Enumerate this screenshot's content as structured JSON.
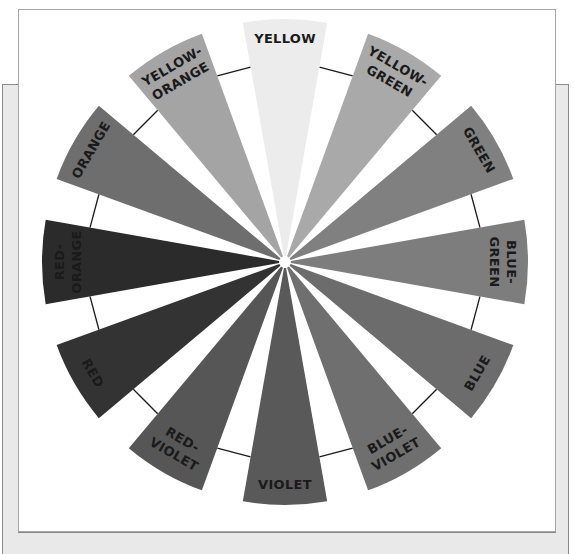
{
  "diagram": {
    "type": "color-wheel",
    "center": [
      285,
      262
    ],
    "outer_radius": 243,
    "inner_radius": 6,
    "wedge_span_deg": 20,
    "step_deg": 30,
    "connector_radius": [
      190,
      206
    ],
    "wedges": [
      {
        "id": "yellow",
        "lines": [
          "YELLOW"
        ],
        "angle": 90,
        "color": "#ececec"
      },
      {
        "id": "yellow-green",
        "lines": [
          "YELLOW-",
          "GREEN"
        ],
        "angle": 60,
        "color": "#a9a9a9"
      },
      {
        "id": "green",
        "lines": [
          "GREEN"
        ],
        "angle": 30,
        "color": "#808080"
      },
      {
        "id": "blue-green",
        "lines": [
          "BLUE-",
          "GREEN"
        ],
        "angle": 0,
        "color": "#7d7d7d"
      },
      {
        "id": "blue",
        "lines": [
          "BLUE"
        ],
        "angle": -30,
        "color": "#6c6c6c"
      },
      {
        "id": "blue-violet",
        "lines": [
          "BLUE-",
          "VIOLET"
        ],
        "angle": -60,
        "color": "#6f6f6f"
      },
      {
        "id": "violet",
        "lines": [
          "VIOLET"
        ],
        "angle": -90,
        "color": "#595959"
      },
      {
        "id": "red-violet",
        "lines": [
          "RED-",
          "VIOLET"
        ],
        "angle": -120,
        "color": "#565656"
      },
      {
        "id": "red",
        "lines": [
          "RED"
        ],
        "angle": -150,
        "color": "#333333"
      },
      {
        "id": "red-orange",
        "lines": [
          "RED-",
          "ORANGE"
        ],
        "angle": 180,
        "color": "#2b2b2b"
      },
      {
        "id": "orange",
        "lines": [
          "ORANGE"
        ],
        "angle": 150,
        "color": "#6e6e6e"
      },
      {
        "id": "yellow-orange",
        "lines": [
          "YELLOW-",
          "ORANGE"
        ],
        "angle": 120,
        "color": "#a4a4a4"
      }
    ],
    "connectors": [
      {
        "between": [
          "yellow",
          "yellow-orange"
        ],
        "angle": 105
      },
      {
        "between": [
          "yellow-green",
          "green"
        ],
        "angle": 45
      },
      {
        "between": [
          "green",
          "blue-green"
        ],
        "angle": 15
      },
      {
        "between": [
          "blue-green",
          "blue"
        ],
        "angle": -15
      },
      {
        "between": [
          "blue",
          "blue-violet"
        ],
        "angle": -45
      },
      {
        "between": [
          "violet",
          "red-violet"
        ],
        "angle": -105
      },
      {
        "between": [
          "red-violet",
          "red"
        ],
        "angle": -135
      },
      {
        "between": [
          "red",
          "red-orange"
        ],
        "angle": -165
      },
      {
        "between": [
          "red-orange",
          "orange"
        ],
        "angle": 165
      },
      {
        "between": [
          "orange",
          "yellow-orange"
        ],
        "angle": 135
      },
      {
        "between": [
          "yellow",
          "yellow-green"
        ],
        "angle": 75
      },
      {
        "between": [
          "blue-violet",
          "violet"
        ],
        "angle": -75
      }
    ]
  },
  "colors": {
    "outer_frame": "#e9e9e9",
    "inner_frame": "#ffffff",
    "connector": "#1a1a1a"
  }
}
